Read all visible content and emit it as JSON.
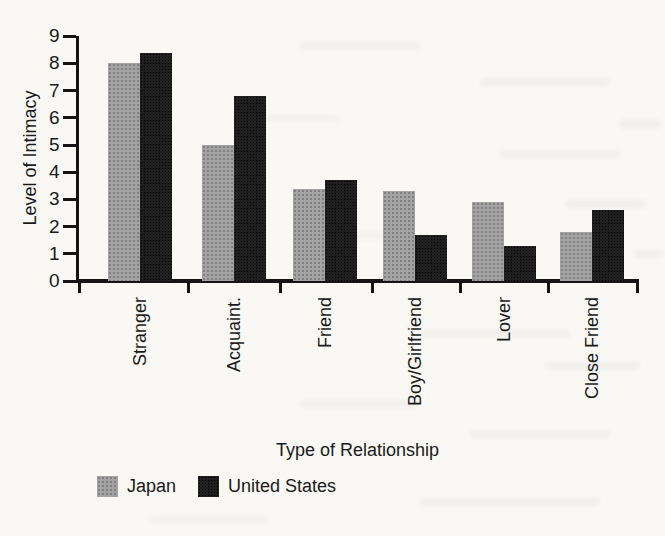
{
  "page": {
    "background": "#f9f8f5",
    "axis_color": "#141414",
    "text_color": "#1a1a1a"
  },
  "chart_data": {
    "type": "bar",
    "title": "",
    "xlabel": "Type of Relationship",
    "ylabel": "Level of Intimacy",
    "categories": [
      "Stranger",
      "Acquaint.",
      "Friend",
      "Boy/Girlfriend",
      "Lover",
      "Close Friend"
    ],
    "series": [
      {
        "name": "Japan",
        "color": "#a3a3a3",
        "values": [
          8.0,
          5.0,
          3.4,
          3.3,
          2.9,
          1.8
        ]
      },
      {
        "name": "United States",
        "color": "#1f1f1f",
        "values": [
          8.4,
          6.8,
          3.7,
          1.7,
          1.3,
          2.6
        ]
      }
    ],
    "ylim": [
      0,
      9
    ],
    "yticks": [
      0,
      1,
      2,
      3,
      4,
      5,
      6,
      7,
      8,
      9
    ],
    "grid": false,
    "legend_position": "bottom-left",
    "category_label_rotation": 90
  }
}
